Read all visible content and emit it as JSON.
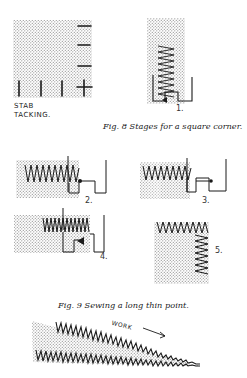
{
  "page": {
    "background": "#ffffff",
    "ink_color": "#1a1a1a",
    "stipple_color": "#9a9a9a"
  },
  "figures": {
    "stab_tacking": {
      "label_line1": "STAB",
      "label_line2": "TACKING."
    },
    "fig8": {
      "caption": "Fig. 8 Stages for a square corner.",
      "stages": [
        {
          "number": "1."
        },
        {
          "number": "2."
        },
        {
          "number": "3."
        },
        {
          "number": "4."
        },
        {
          "number": "5."
        }
      ]
    },
    "fig9": {
      "caption": "Fig. 9 Sewing a long thin point.",
      "annotation": "WORK",
      "arrow": "arrow-right-icon"
    }
  }
}
